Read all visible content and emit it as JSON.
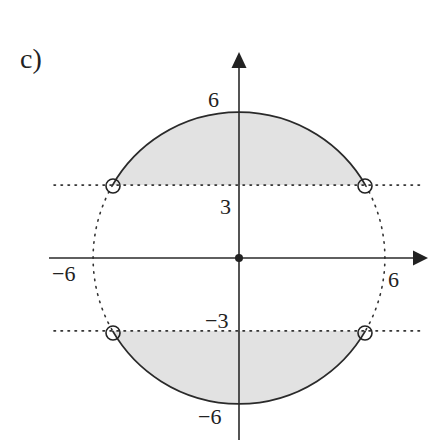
{
  "figure": {
    "part_label": "c)",
    "axes": {
      "x_ticks": [
        {
          "value": -6,
          "label": "−6"
        },
        {
          "value": 6,
          "label": "6"
        }
      ],
      "y_ticks": [
        {
          "value": 6,
          "label": "6"
        },
        {
          "value": 3,
          "label": "3"
        },
        {
          "value": -3,
          "label": "−3"
        },
        {
          "value": -6,
          "label": "−6"
        }
      ],
      "origin_marker": "filled-dot"
    },
    "circle": {
      "radius": 6,
      "solid_arcs": [
        "upper: y >= 3",
        "lower: y <= -3"
      ],
      "dotted_arcs": [
        "side parts: -3 < y < 3"
      ]
    },
    "dotted_lines": [
      {
        "y": 3
      },
      {
        "y": -3
      }
    ],
    "open_points": [
      {
        "x": -5.196,
        "y": 3
      },
      {
        "x": 5.196,
        "y": 3
      },
      {
        "x": -5.196,
        "y": -3
      },
      {
        "x": 5.196,
        "y": -3
      }
    ],
    "colors": {
      "shade": "#e2e2e2",
      "line": "#2a2a2a"
    }
  }
}
